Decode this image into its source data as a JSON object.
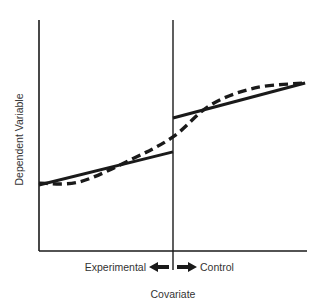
{
  "chart_data": {
    "type": "line",
    "title": "",
    "xlabel": "Covariate",
    "ylabel": "Dependent Variable",
    "xlim": [
      0,
      10
    ],
    "ylim": [
      0,
      10
    ],
    "grid": false,
    "cutoff": 5,
    "cutoff_labels": {
      "left": "Experimental",
      "right": "Control"
    },
    "series": [
      {
        "name": "Experimental regression",
        "style": "solid",
        "x": [
          0,
          5
        ],
        "y": [
          2.86,
          4.29
        ]
      },
      {
        "name": "Control regression",
        "style": "solid",
        "x": [
          5,
          9.93
        ],
        "y": [
          5.76,
          7.27
        ]
      },
      {
        "name": "Underlying curvilinear relationship",
        "style": "dashed",
        "x": [
          0,
          1.5,
          3.4,
          5,
          6.4,
          8.06,
          9.93
        ],
        "y": [
          2.94,
          2.99,
          3.94,
          4.94,
          6.32,
          7.06,
          7.27
        ]
      }
    ]
  },
  "colors": {
    "ink": "#1a1a1a",
    "text": "#333333",
    "background": "#ffffff"
  }
}
